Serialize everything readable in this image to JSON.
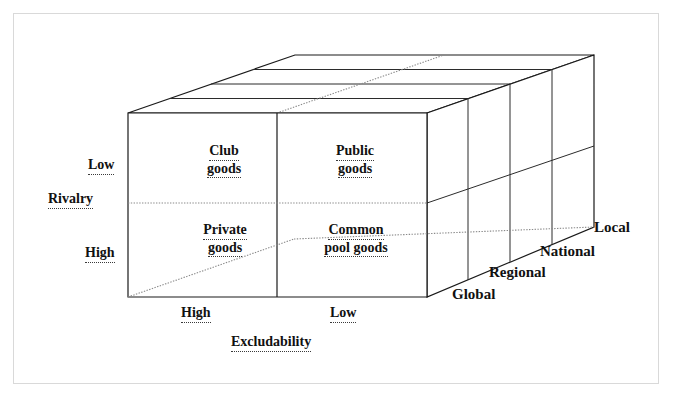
{
  "figure": {
    "type": "3d-matrix-diagram",
    "axes": {
      "vertical": {
        "name": "Rivalry",
        "ticks": [
          "Low",
          "High"
        ]
      },
      "horizontal": {
        "name": "Excludability",
        "ticks": [
          "High",
          "Low"
        ]
      },
      "depth": {
        "name": "",
        "ticks": [
          "Global",
          "Regional",
          "National",
          "Local"
        ]
      }
    },
    "cells": [
      {
        "id": "club-goods",
        "rivalry": "Low",
        "excludability": "High",
        "line1": "Club",
        "line2": "goods"
      },
      {
        "id": "public-goods",
        "rivalry": "Low",
        "excludability": "Low",
        "line1": "Public",
        "line2": "goods"
      },
      {
        "id": "private-goods",
        "rivalry": "High",
        "excludability": "High",
        "line1": "Private",
        "line2": "goods"
      },
      {
        "id": "common-pool-goods",
        "rivalry": "High",
        "excludability": "Low",
        "line1": "Common",
        "line2": "pool goods"
      }
    ],
    "colors": {
      "line": "#1a1a1a",
      "hidden_line": "#8a8a8a",
      "text": "#111111",
      "background": "#ffffff",
      "border": "#d9d9d9"
    }
  },
  "labels": {
    "rivalry_low": "Low",
    "rivalry_name": "Rivalry",
    "rivalry_high": "High",
    "exclud_high": "High",
    "exclud_low": "Low",
    "exclud_name": "Excludability",
    "depth_global": "Global",
    "depth_regional": "Regional",
    "depth_national": "National",
    "depth_local": "Local",
    "club_1": "Club",
    "club_2": "goods",
    "public_1": "Public",
    "public_2": "goods",
    "private_1": "Private",
    "private_2": "goods",
    "common_1": "Common",
    "common_2": "pool goods"
  }
}
